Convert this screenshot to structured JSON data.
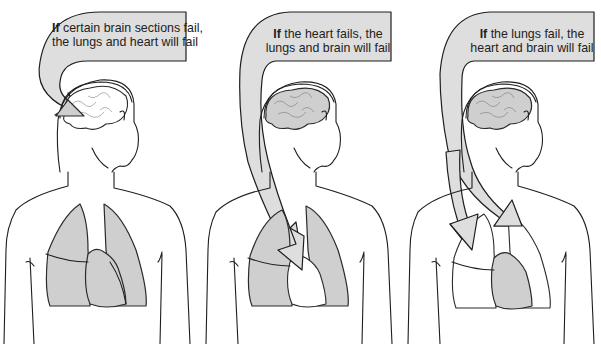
{
  "figure": {
    "colors": {
      "organ_fill": "#cfcfcf",
      "arrow_fill": "#dedede",
      "line": "#1e1e1e",
      "background": "#ffffff"
    },
    "panels": [
      {
        "id": "brain-failure",
        "failing_organ": "brain",
        "affected_organs": [
          "lungs",
          "heart"
        ],
        "label_bold": "If",
        "label_line1_rest": " certain brain sections fail,",
        "label_line2": "the lungs and heart will fail"
      },
      {
        "id": "heart-failure",
        "failing_organ": "heart",
        "affected_organs": [
          "lungs",
          "brain"
        ],
        "label_bold": "If",
        "label_line1_rest": " the heart fails, the",
        "label_line2": "lungs and brain will fail"
      },
      {
        "id": "lung-failure",
        "failing_organ": "lungs",
        "affected_organs": [
          "heart",
          "brain"
        ],
        "label_bold": "If",
        "label_line1_rest": " the lungs fail, the",
        "label_line2": "heart and brain will fail"
      }
    ]
  }
}
